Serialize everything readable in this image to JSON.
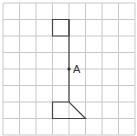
{
  "figure": {
    "type": "grid-diagram",
    "grid": {
      "columns": 8,
      "rows": 8,
      "origin_x": 3,
      "origin_y": 3,
      "cell_size": 16.5,
      "line_color": "#c8c8c8"
    },
    "shape_color": "#444444",
    "point": {
      "label": "A",
      "grid_x": 4,
      "grid_y": 4
    },
    "shapes": [
      {
        "name": "top-square",
        "points_grid": [
          [
            3,
            1
          ],
          [
            4,
            1
          ],
          [
            4,
            2
          ],
          [
            3,
            2
          ]
        ]
      },
      {
        "name": "vertical-line",
        "points_grid": [
          [
            4,
            1
          ],
          [
            4,
            6
          ]
        ]
      },
      {
        "name": "bottom-shape",
        "points_grid": [
          [
            4,
            6
          ],
          [
            3,
            6
          ],
          [
            3,
            7
          ],
          [
            5,
            7
          ]
        ]
      }
    ]
  }
}
